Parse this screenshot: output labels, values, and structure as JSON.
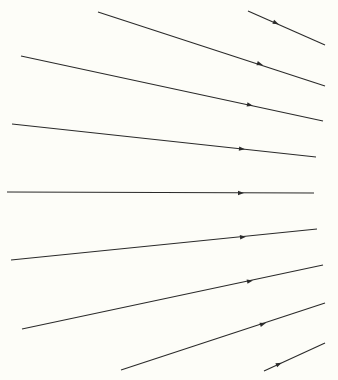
{
  "diagram": {
    "title": "",
    "background": "#fdfdf8",
    "stroke_color": "#2a2a2a",
    "rays": [
      {
        "x1": 248,
        "y1": 11,
        "x2": 325,
        "y2": 45,
        "ax": 276,
        "ay": 23
      },
      {
        "x1": 98,
        "y1": 12,
        "x2": 325,
        "y2": 86,
        "ax": 260,
        "ay": 64
      },
      {
        "x1": 21,
        "y1": 56,
        "x2": 323,
        "y2": 121,
        "ax": 250,
        "ay": 105
      },
      {
        "x1": 12,
        "y1": 124,
        "x2": 316,
        "y2": 157,
        "ax": 242,
        "ay": 149
      },
      {
        "x1": 7,
        "y1": 192,
        "x2": 314,
        "y2": 193,
        "ax": 241,
        "ay": 193
      },
      {
        "x1": 11,
        "y1": 260,
        "x2": 317,
        "y2": 229,
        "ax": 243,
        "ay": 237
      },
      {
        "x1": 22,
        "y1": 329,
        "x2": 323,
        "y2": 265,
        "ax": 250,
        "ay": 281
      },
      {
        "x1": 121,
        "y1": 370,
        "x2": 325,
        "y2": 303,
        "ax": 263,
        "ay": 324
      },
      {
        "x1": 264,
        "y1": 371,
        "x2": 325,
        "y2": 343,
        "ax": 279,
        "ay": 364
      }
    ]
  }
}
